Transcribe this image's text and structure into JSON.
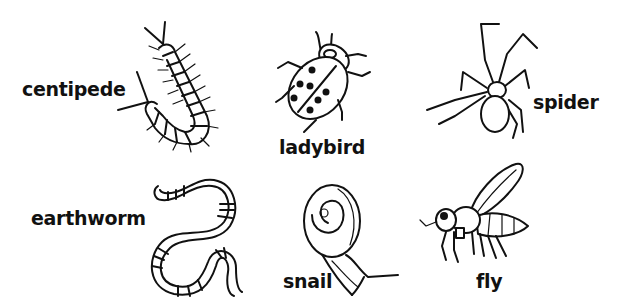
{
  "worksheet": {
    "animals": [
      {
        "id": "centipede",
        "label": "centipede"
      },
      {
        "id": "ladybird",
        "label": "ladybird"
      },
      {
        "id": "spider",
        "label": "spider"
      },
      {
        "id": "earthworm",
        "label": "earthworm"
      },
      {
        "id": "snail",
        "label": "snail"
      },
      {
        "id": "fly",
        "label": "fly"
      }
    ],
    "colors": {
      "ink": "#111111",
      "background": "#ffffff"
    }
  }
}
